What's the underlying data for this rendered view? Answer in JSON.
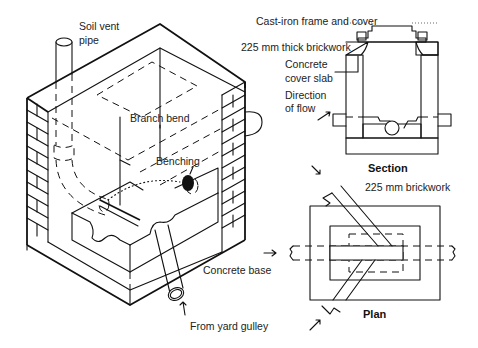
{
  "figure": {
    "labels": {
      "soil_vent_pipe_1": "Soil vent",
      "soil_vent_pipe_2": "pipe",
      "branch_bend": "Branch bend",
      "benching": "Benching",
      "cast_iron_frame": "Cast-iron frame and cover",
      "brickwork_225_thick": "225 mm thick brickwork",
      "concrete_cover_slab_1": "Concrete",
      "concrete_cover_slab_2": "cover slab",
      "direction_of_flow_1": "Direction",
      "direction_of_flow_2": "of flow",
      "section_title": "Section",
      "brickwork_225": "225 mm brickwork",
      "concrete_base": "Concrete base",
      "plan_title": "Plan",
      "from_yard_gulley": "From yard gulley"
    },
    "views": [
      "isometric-cutaway",
      "section",
      "plan"
    ],
    "colors": {
      "line": "#111111",
      "background": "#ffffff"
    }
  }
}
